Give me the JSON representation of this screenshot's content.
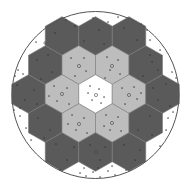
{
  "diagram": {
    "type": "hexagonal-array-in-circle",
    "outer_circle": {
      "cx": 95.5,
      "cy": 95,
      "r": 83.5,
      "stroke": "#555555"
    },
    "hex": {
      "width": 33.5,
      "height": 38.7,
      "orientation": "pointy-top"
    },
    "colors": {
      "outer_ring": "#5a5a5a",
      "inner_ring": "#bdbdbd",
      "center": "#ffffff",
      "edge": "#7a7a7a",
      "dot": "#333333"
    },
    "cells": [
      {
        "cx": 62,
        "cy": 36,
        "ring": "outer_ring"
      },
      {
        "cx": 95.5,
        "cy": 36,
        "ring": "outer_ring"
      },
      {
        "cx": 129,
        "cy": 36,
        "ring": "outer_ring"
      },
      {
        "cx": 45.25,
        "cy": 65,
        "ring": "outer_ring"
      },
      {
        "cx": 78.75,
        "cy": 65,
        "ring": "inner_ring"
      },
      {
        "cx": 112.25,
        "cy": 65,
        "ring": "inner_ring"
      },
      {
        "cx": 145.75,
        "cy": 65,
        "ring": "outer_ring"
      },
      {
        "cx": 28.5,
        "cy": 94,
        "ring": "outer_ring"
      },
      {
        "cx": 62,
        "cy": 94,
        "ring": "inner_ring"
      },
      {
        "cx": 95.5,
        "cy": 94,
        "ring": "center"
      },
      {
        "cx": 129,
        "cy": 94,
        "ring": "inner_ring"
      },
      {
        "cx": 162.5,
        "cy": 94,
        "ring": "outer_ring"
      },
      {
        "cx": 45.25,
        "cy": 123,
        "ring": "outer_ring"
      },
      {
        "cx": 78.75,
        "cy": 123,
        "ring": "inner_ring"
      },
      {
        "cx": 112.25,
        "cy": 123,
        "ring": "inner_ring"
      },
      {
        "cx": 145.75,
        "cy": 123,
        "ring": "outer_ring"
      },
      {
        "cx": 62,
        "cy": 152,
        "ring": "outer_ring"
      },
      {
        "cx": 95.5,
        "cy": 152,
        "ring": "outer_ring"
      },
      {
        "cx": 129,
        "cy": 152,
        "ring": "outer_ring"
      }
    ],
    "markers": [
      {
        "x": 79,
        "y": 66,
        "r": 1.6
      },
      {
        "x": 112,
        "y": 66,
        "r": 1.6
      },
      {
        "x": 62,
        "y": 94,
        "r": 1.6
      },
      {
        "x": 96,
        "y": 95,
        "r": 1.6
      },
      {
        "x": 129,
        "y": 95,
        "r": 1.6
      },
      {
        "x": 79,
        "y": 124,
        "r": 1.6
      },
      {
        "x": 112,
        "y": 123,
        "r": 1.6
      },
      {
        "x": 96,
        "y": 152,
        "r": 1.6
      },
      {
        "x": 45,
        "y": 43,
        "r": 1.2
      }
    ],
    "dots": [
      [
        66,
        20
      ],
      [
        93,
        18
      ],
      [
        108,
        22
      ],
      [
        118,
        17
      ],
      [
        75,
        26
      ],
      [
        84,
        41
      ],
      [
        99,
        30
      ],
      [
        104,
        44
      ],
      [
        124,
        28
      ],
      [
        137,
        40
      ],
      [
        141,
        24
      ],
      [
        55,
        33
      ],
      [
        48,
        55
      ],
      [
        37,
        60
      ],
      [
        52,
        72
      ],
      [
        41,
        79
      ],
      [
        150,
        55
      ],
      [
        158,
        70
      ],
      [
        143,
        76
      ],
      [
        152,
        62
      ],
      [
        160,
        50
      ],
      [
        71,
        58
      ],
      [
        84,
        58
      ],
      [
        86,
        71
      ],
      [
        75,
        76
      ],
      [
        107,
        57
      ],
      [
        118,
        60
      ],
      [
        110,
        70
      ],
      [
        120,
        74
      ],
      [
        105,
        78
      ],
      [
        17,
        85
      ],
      [
        25,
        100
      ],
      [
        34,
        90
      ],
      [
        20,
        108
      ],
      [
        37,
        104
      ],
      [
        166,
        84
      ],
      [
        158,
        100
      ],
      [
        170,
        106
      ],
      [
        153,
        88
      ],
      [
        54,
        86
      ],
      [
        67,
        88
      ],
      [
        57,
        101
      ],
      [
        69,
        104
      ],
      [
        49,
        96
      ],
      [
        90,
        86
      ],
      [
        99,
        89
      ],
      [
        104,
        97
      ],
      [
        92,
        100
      ],
      [
        88,
        93
      ],
      [
        101,
        103
      ],
      [
        122,
        88
      ],
      [
        134,
        87
      ],
      [
        137,
        99
      ],
      [
        125,
        104
      ],
      [
        141,
        93
      ],
      [
        72,
        115
      ],
      [
        84,
        118
      ],
      [
        76,
        130
      ],
      [
        87,
        133
      ],
      [
        68,
        124
      ],
      [
        106,
        115
      ],
      [
        118,
        117
      ],
      [
        110,
        130
      ],
      [
        121,
        131
      ],
      [
        104,
        126
      ],
      [
        38,
        118
      ],
      [
        50,
        130
      ],
      [
        44,
        138
      ],
      [
        150,
        116
      ],
      [
        138,
        130
      ],
      [
        152,
        135
      ],
      [
        56,
        144
      ],
      [
        67,
        160
      ],
      [
        74,
        147
      ],
      [
        90,
        145
      ],
      [
        100,
        160
      ],
      [
        105,
        147
      ],
      [
        124,
        145
      ],
      [
        135,
        160
      ],
      [
        140,
        150
      ],
      [
        18,
        70
      ],
      [
        15,
        76
      ],
      [
        23,
        74
      ],
      [
        172,
        72
      ],
      [
        176,
        78
      ],
      [
        173,
        112
      ],
      [
        168,
        118
      ],
      [
        20,
        116
      ],
      [
        14,
        110
      ],
      [
        80,
        173
      ],
      [
        86,
        176
      ],
      [
        93,
        172
      ],
      [
        100,
        177
      ],
      [
        108,
        171
      ],
      [
        115,
        175
      ],
      [
        84,
        168
      ],
      [
        98,
        168
      ],
      [
        112,
        166
      ],
      [
        60,
        170
      ],
      [
        126,
        170
      ],
      [
        36,
        42
      ],
      [
        150,
        40
      ],
      [
        147,
        30
      ],
      [
        31,
        140
      ],
      [
        160,
        146
      ],
      [
        166,
        130
      ],
      [
        26,
        128
      ]
    ]
  }
}
